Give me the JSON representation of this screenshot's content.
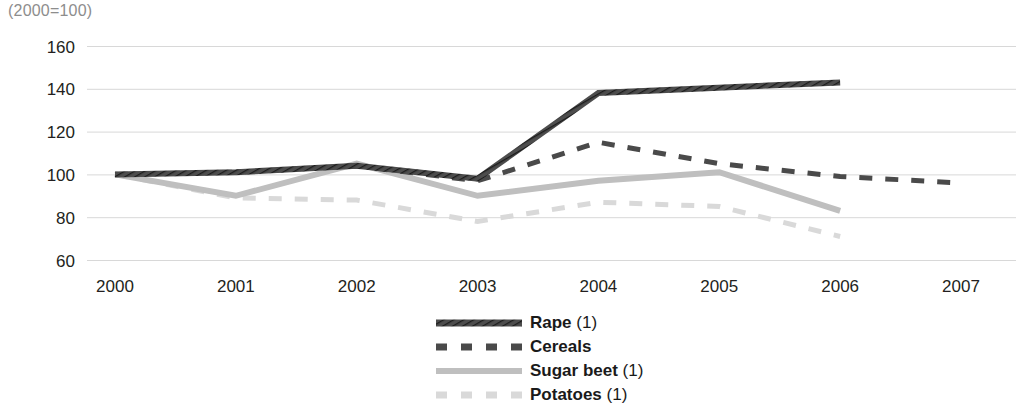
{
  "unit_note": "(2000=100)",
  "legend": {
    "items": [
      {
        "label": "Rape (1)",
        "name": "legend-item-rape",
        "color": "#3f3f3f",
        "style": "hatched-solid"
      },
      {
        "label": "Cereals",
        "name": "legend-item-cereals",
        "color": "#4a4a4a",
        "style": "dashed"
      },
      {
        "label": "Sugar beet (1)",
        "name": "legend-item-sugar-beet",
        "color": "#bfbfbf",
        "style": "solid"
      },
      {
        "label": "Potatoes (1)",
        "name": "legend-item-potatoes",
        "color": "#d9d9d9",
        "style": "dashed"
      }
    ]
  },
  "chart_data": {
    "type": "line",
    "title": "",
    "subtitle": "(2000=100)",
    "xlabel": "",
    "ylabel": "",
    "x": [
      2000,
      2001,
      2002,
      2003,
      2004,
      2005,
      2006,
      2007
    ],
    "categories": [
      "2000",
      "2001",
      "2002",
      "2003",
      "2004",
      "2005",
      "2006",
      "2007"
    ],
    "xlim": [
      2000,
      2007
    ],
    "ylim": [
      60,
      160
    ],
    "yticks": [
      60,
      80,
      100,
      120,
      140,
      160
    ],
    "ytick_labels": [
      "60",
      "80",
      "100",
      "120",
      "140",
      "160"
    ],
    "grid": "horizontal",
    "legend_position": "bottom-center",
    "series": [
      {
        "name": "Rape (1)",
        "color": "#3f3f3f",
        "style": "hatched-solid",
        "linewidth": 6,
        "x": [
          2000,
          2001,
          2002,
          2003,
          2004,
          2006
        ],
        "values": [
          100,
          101,
          104,
          98,
          138,
          143
        ]
      },
      {
        "name": "Cereals",
        "color": "#4a4a4a",
        "style": "dashed",
        "linewidth": 5,
        "x": [
          2000,
          2001,
          2002,
          2003,
          2004,
          2005,
          2006,
          2007
        ],
        "values": [
          100,
          101,
          104,
          97,
          115,
          105,
          99,
          96
        ]
      },
      {
        "name": "Sugar beet (1)",
        "color": "#bfbfbf",
        "style": "solid",
        "linewidth": 6,
        "x": [
          2000,
          2001,
          2002,
          2003,
          2004,
          2005,
          2006
        ],
        "values": [
          100,
          90,
          105,
          90,
          97,
          101,
          83
        ]
      },
      {
        "name": "Potatoes (1)",
        "color": "#d9d9d9",
        "style": "dashed",
        "linewidth": 5,
        "x": [
          2000,
          2001,
          2002,
          2003,
          2004,
          2005,
          2006
        ],
        "values": [
          100,
          89,
          88,
          78,
          87,
          85,
          71
        ]
      }
    ]
  }
}
